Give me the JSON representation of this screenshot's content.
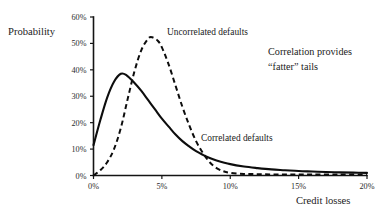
{
  "axis_labels": {
    "y_title": "Probability",
    "x_title": "Credit losses"
  },
  "annotations": {
    "uncorrelated": "Uncorrelated defaults",
    "correlated": "Correlated defaults",
    "note_line1": "Correlation  provides",
    "note_line2": "“fatter” tails"
  },
  "colors": {
    "axis": "#141414",
    "curve": "#0d0d0d",
    "background": "#ffffff",
    "text": "#222222"
  },
  "chart_data": {
    "type": "line",
    "title": "",
    "subtitle": "",
    "xlabel": "Credit losses",
    "ylabel": "Probability",
    "xlim": [
      0,
      20
    ],
    "ylim": [
      0,
      60
    ],
    "xticks": [
      0,
      5,
      10,
      15,
      20
    ],
    "xtick_labels": [
      "0%",
      "5%",
      "10%",
      "15%",
      "20%"
    ],
    "yticks": [
      0,
      10,
      20,
      30,
      40,
      50,
      60
    ],
    "ytick_labels": [
      "0%",
      "10%",
      "20%",
      "30%",
      "40%",
      "50%",
      "60%"
    ],
    "grid": false,
    "legend": "inline-annotations",
    "series": [
      {
        "name": "Correlated defaults",
        "style": "solid",
        "x": [
          0,
          0.5,
          1.0,
          1.5,
          2.0,
          2.4,
          3.0,
          3.5,
          4.0,
          4.5,
          5.0,
          5.5,
          6.0,
          6.5,
          7.0,
          7.5,
          8.0,
          8.5,
          9.0,
          10.0,
          11.0,
          12.0,
          13.0,
          14.0,
          15.0,
          16.0,
          17.0,
          18.0,
          19.0,
          20.0
        ],
        "values": [
          11.5,
          21.0,
          29.5,
          35.5,
          38.5,
          38.0,
          35.0,
          32.0,
          28.5,
          25.0,
          21.5,
          18.5,
          15.5,
          13.0,
          11.0,
          9.2,
          7.8,
          6.6,
          5.7,
          4.3,
          3.4,
          2.8,
          2.3,
          2.0,
          1.7,
          1.5,
          1.3,
          1.2,
          1.1,
          1.0
        ]
      },
      {
        "name": "Uncorrelated defaults",
        "style": "dashed",
        "x": [
          0,
          0.5,
          1.0,
          1.5,
          2.0,
          2.5,
          3.0,
          3.5,
          4.0,
          4.3,
          4.7,
          5.0,
          5.5,
          6.0,
          6.5,
          7.0,
          7.5,
          8.0,
          8.5,
          9.0,
          9.5,
          10.0,
          11.0,
          12.0,
          13.0,
          14.0,
          15.0,
          16.0,
          18.0,
          20.0
        ],
        "values": [
          0.0,
          2.0,
          5.0,
          10.0,
          18.0,
          29.0,
          39.5,
          47.5,
          51.8,
          52.3,
          51.0,
          48.5,
          42.0,
          34.0,
          26.0,
          19.0,
          13.0,
          8.5,
          5.0,
          2.8,
          1.6,
          1.0,
          0.6,
          0.5,
          0.4,
          0.4,
          0.4,
          0.4,
          0.4,
          0.4
        ]
      }
    ]
  }
}
